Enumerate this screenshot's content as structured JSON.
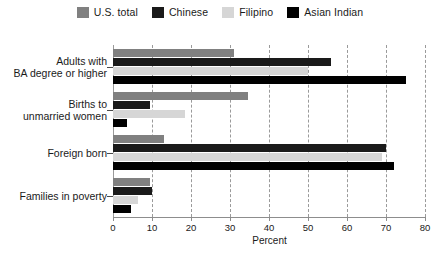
{
  "chart_data": {
    "type": "bar",
    "orientation": "horizontal",
    "title": "",
    "xlabel": "Percent",
    "ylabel": "",
    "xlim": [
      0,
      80
    ],
    "xticks": [
      0,
      10,
      20,
      30,
      40,
      50,
      60,
      70,
      80
    ],
    "grid": true,
    "legend_position": "top",
    "categories": [
      "Adults with\nBA degree or higher",
      "Births to\nunmarried women",
      "Foreign born",
      "Families in poverty"
    ],
    "series": [
      {
        "name": "U.S. total",
        "color": "#808080",
        "values": [
          31.0,
          34.5,
          13.0,
          9.5
        ]
      },
      {
        "name": "Chinese",
        "color": "#1a1a1a",
        "values": [
          56.0,
          9.5,
          70.0,
          10.0
        ]
      },
      {
        "name": "Filipino",
        "color": "#d6d6d6",
        "values": [
          50.0,
          18.5,
          69.0,
          6.5
        ]
      },
      {
        "name": "Asian Indian",
        "color": "#000000",
        "values": [
          75.0,
          3.5,
          72.0,
          4.5
        ]
      }
    ]
  },
  "colors": {
    "background": "#ffffff",
    "grid": "#9a9a9a",
    "axis": "#8d8d8d",
    "text": "#1a1a1a"
  }
}
